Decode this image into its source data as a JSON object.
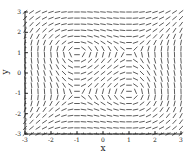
{
  "chart_data": {
    "type": "direction_field",
    "title": "",
    "xlabel": "x",
    "ylabel": "y",
    "xlim": [
      -3,
      3
    ],
    "ylim": [
      -3,
      3
    ],
    "xticks": [
      -3,
      -2,
      -1,
      0,
      1,
      2,
      3
    ],
    "yticks": [
      -3,
      -2,
      -1,
      0,
      1,
      2,
      3
    ],
    "xtick_labels": [
      "-3",
      "-2",
      "-1",
      "0",
      "1",
      "2",
      "3"
    ],
    "ytick_labels": [
      "-3",
      "-2",
      "-1",
      "0",
      "1",
      "2",
      "3"
    ],
    "slope_equation": "dy/dx = (x^2 - 1) / (y^2 - 1)",
    "grid_columns": 25,
    "grid_rows": 21,
    "centers": [
      [
        -1,
        1
      ],
      [
        1,
        -1
      ]
    ],
    "saddles": [
      [
        1,
        1
      ],
      [
        -1,
        -1
      ]
    ],
    "grid": false,
    "legend": null,
    "segment_color": "#333333"
  },
  "axes": {
    "x_label": "x",
    "y_label": "y"
  }
}
